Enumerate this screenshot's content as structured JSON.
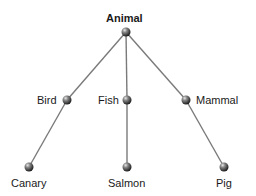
{
  "diagram": {
    "type": "tree",
    "edge_color": "#7a7a7a",
    "node_color": "#4a4a4a",
    "root": {
      "id": "animal",
      "label": "Animal",
      "x": 126,
      "y": 32
    },
    "categories": [
      {
        "id": "bird",
        "label": "Bird",
        "x": 67,
        "y": 100,
        "parent": "animal"
      },
      {
        "id": "fish",
        "label": "Fish",
        "x": 127,
        "y": 100,
        "parent": "animal"
      },
      {
        "id": "mammal",
        "label": "Mammal",
        "x": 186,
        "y": 100,
        "parent": "animal"
      }
    ],
    "leaves": [
      {
        "id": "canary",
        "label": "Canary",
        "x": 29,
        "y": 167,
        "parent": "bird"
      },
      {
        "id": "salmon",
        "label": "Salmon",
        "x": 127,
        "y": 167,
        "parent": "fish"
      },
      {
        "id": "pig",
        "label": "Pig",
        "x": 224,
        "y": 167,
        "parent": "mammal"
      }
    ]
  }
}
